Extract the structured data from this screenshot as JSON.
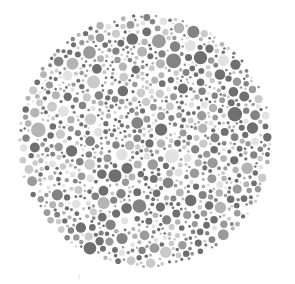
{
  "image": {
    "kind": "ishihara-color-vision-test-plate",
    "title": "Ishihara Test Plate",
    "rendering": "grayscale",
    "background_color": "#ffffff",
    "width": 295,
    "height": 284
  },
  "plate": {
    "shape": "circle",
    "center_x": 145,
    "center_y": 141,
    "radius": 128,
    "dot_count": 742,
    "dot_min_diameter": 2.5,
    "dot_max_diameter": 15,
    "hidden_figure_visible": false,
    "hidden_figure_label": ""
  },
  "palette": {
    "tones": [
      {
        "name": "dark",
        "color": "#6f6f6f",
        "weight": 0.3
      },
      {
        "name": "medium-dark",
        "color": "#838383",
        "weight": 0.14
      },
      {
        "name": "medium",
        "color": "#9a9a9a",
        "weight": 0.16
      },
      {
        "name": "medium-light",
        "color": "#b4b4b4",
        "weight": 0.14
      },
      {
        "name": "light",
        "color": "#cacaca",
        "weight": 0.16
      },
      {
        "name": "very-light",
        "color": "#e2e2e2",
        "weight": 0.1
      }
    ],
    "background": "#ffffff"
  },
  "artifact": {
    "present": true,
    "x": 78,
    "y": 274,
    "color": "#efefef"
  },
  "chart_data": {
    "type": "scatter",
    "xlabel": "",
    "ylabel": "",
    "xlim": [
      17,
      273
    ],
    "ylim": [
      13,
      269
    ],
    "grid": false,
    "legend": "none",
    "series": [
      {
        "name": "dark",
        "color": "#6f6f6f",
        "marker": "circle",
        "approx_count": 223
      },
      {
        "name": "medium-dark",
        "color": "#838383",
        "marker": "circle",
        "approx_count": 104
      },
      {
        "name": "medium",
        "color": "#9a9a9a",
        "marker": "circle",
        "approx_count": 119
      },
      {
        "name": "medium-light",
        "color": "#b4b4b4",
        "marker": "circle",
        "approx_count": 104
      },
      {
        "name": "light",
        "color": "#cacaca",
        "marker": "circle",
        "approx_count": 118
      },
      {
        "name": "very-light",
        "color": "#e2e2e2",
        "marker": "circle",
        "approx_count": 74
      }
    ]
  }
}
